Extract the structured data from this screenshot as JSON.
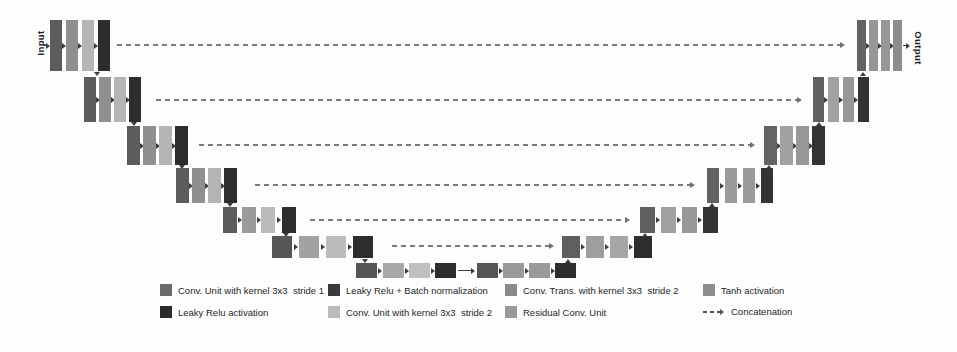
{
  "figure": {
    "type": "u-net-architecture-diagram",
    "input_label": "Input",
    "output_label": "Output",
    "background": "#fdfdfd",
    "arrow_color": "#3d3d3d",
    "concat_dash_color": "#7a7a7a"
  },
  "unet": {
    "bars_per_level": 4,
    "encoder_levels": [
      {
        "name": "encoder-level-1",
        "colors": [
          "#5c5c5c",
          "#8f8f8f",
          "#b4b4b4",
          "#2d2d2d"
        ]
      },
      {
        "name": "encoder-level-2",
        "colors": [
          "#5c5c5c",
          "#8f8f8f",
          "#b4b4b4",
          "#2d2d2d"
        ]
      },
      {
        "name": "encoder-level-3",
        "colors": [
          "#5c5c5c",
          "#8f8f8f",
          "#b4b4b4",
          "#2d2d2d"
        ]
      },
      {
        "name": "encoder-level-4",
        "colors": [
          "#5c5c5c",
          "#8f8f8f",
          "#b4b4b4",
          "#2d2d2d"
        ]
      },
      {
        "name": "encoder-level-5",
        "colors": [
          "#5c5c5c",
          "#9b9b9b",
          "#bcbcbc",
          "#2d2d2d"
        ]
      },
      {
        "name": "encoder-level-6",
        "colors": [
          "#565656",
          "#a2a2a2",
          "#bcbcbc",
          "#2d2d2d"
        ]
      }
    ],
    "bottleneck": {
      "name": "bottleneck",
      "colors": [
        "#555555",
        "#a9a9a9",
        "#c0c0c0",
        "#2d2d2d",
        "#555555",
        "#9a9a9a",
        "#9a9a9a",
        "#2d2d2d"
      ]
    },
    "decoder_levels": [
      {
        "name": "decoder-level-1-output",
        "colors": [
          "#646464",
          "#979797",
          "#979797",
          "#8d8d8d"
        ]
      },
      {
        "name": "decoder-level-2",
        "colors": [
          "#606060",
          "#a2a2a2",
          "#979797",
          "#333333"
        ]
      },
      {
        "name": "decoder-level-3",
        "colors": [
          "#636363",
          "#a2a2a2",
          "#979797",
          "#333333"
        ]
      },
      {
        "name": "decoder-level-4",
        "colors": [
          "#636363",
          "#9b9b9b",
          "#9b9b9b",
          "#333333"
        ]
      },
      {
        "name": "decoder-level-5",
        "colors": [
          "#606060",
          "#a0a0a0",
          "#989898",
          "#333333"
        ]
      },
      {
        "name": "decoder-level-6",
        "colors": [
          "#5e5e5e",
          "#9e9e9e",
          "#a6a6a6",
          "#2d2d2d"
        ]
      }
    ],
    "skip_connections": 6,
    "skip_connection_type": "Concatenation"
  },
  "legend": {
    "rows": [
      [
        {
          "swatch": "#6b6b6b",
          "label": "Conv. Unit with kernel 3x3  stride 1"
        },
        {
          "swatch": "#3a3a3a",
          "label": "Leaky Relu + Batch normalization"
        },
        {
          "swatch": "#8a8a8a",
          "label": "Conv. Trans. with kernel 3x3  stride 2"
        },
        {
          "swatch": "#8d8d8d",
          "label": "Tanh activation"
        }
      ],
      [
        {
          "swatch": "#2b2b2b",
          "label": "Leaky Relu activation"
        },
        {
          "swatch": "#bcbcbc",
          "label": "Conv. Unit with kernel 3x3  stride 2"
        },
        {
          "swatch": "#9a9a9a",
          "label": "Residual Conv. Unit"
        },
        {
          "swatch": "dashed",
          "label": "Concatenation"
        }
      ]
    ]
  }
}
